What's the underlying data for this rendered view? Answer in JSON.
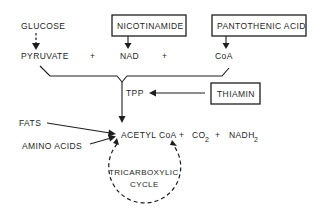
{
  "diagram": {
    "type": "metabolic-pathway",
    "nodes": {
      "glucose": "GLUCOSE",
      "nicotinamide": "NICOTINAMIDE",
      "pantothenic_acid": "PANTOTHENIC ACID",
      "pyruvate": "PYRUVATE",
      "plus_1": "+",
      "nad": "NAD",
      "plus_2": "+",
      "coa": "CoA",
      "tpp": "TPP",
      "thiamin": "THIAMIN",
      "fats": "FATS",
      "amino_acids": "AMINO ACIDS",
      "acetyl_coa": "ACETYL CoA",
      "plus_3": "+",
      "co2_base": "CO",
      "co2_sub": "2",
      "plus_4": "+",
      "nadh2_base": "NADH",
      "nadh2_sub": "2",
      "cycle_line1": "TRICARBOXYLIC",
      "cycle_line2": "CYCLE"
    },
    "boxed_nodes": [
      "NICOTINAMIDE",
      "PANTOTHENIC ACID",
      "THIAMIN"
    ],
    "edges": [
      {
        "from": "GLUCOSE",
        "to": "PYRUVATE",
        "style": "dashed"
      },
      {
        "from": "NICOTINAMIDE",
        "to": "NAD",
        "style": "solid"
      },
      {
        "from": "PANTOTHENIC ACID",
        "to": "CoA",
        "style": "solid"
      },
      {
        "from": "PYRUVATE + NAD + CoA",
        "to": "ACETYL CoA",
        "style": "solid",
        "via": "TPP"
      },
      {
        "from": "THIAMIN",
        "to": "TPP",
        "style": "solid"
      },
      {
        "from": "FATS",
        "to": "ACETYL CoA",
        "style": "solid"
      },
      {
        "from": "AMINO ACIDS",
        "to": "ACETYL CoA",
        "style": "solid"
      },
      {
        "from": "ACETYL CoA",
        "to": "TRICARBOXYLIC CYCLE",
        "style": "dashed-cycle"
      }
    ],
    "colors": {
      "ink": "#1e1e1e",
      "background": "#ffffff"
    }
  }
}
